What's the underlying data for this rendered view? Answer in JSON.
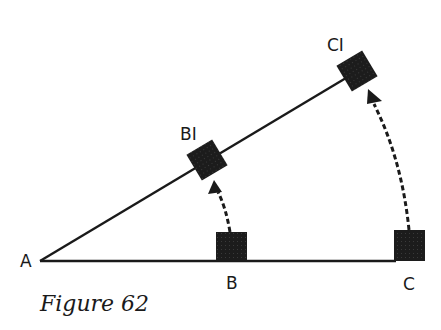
{
  "figure": {
    "caption": "Figure 62",
    "colors": {
      "ink": "#1a1a1a",
      "background": "#ffffff"
    },
    "points": {
      "A": {
        "label": "A"
      },
      "B": {
        "label": "B"
      },
      "C": {
        "label": "C"
      },
      "B1": {
        "label": "BI"
      },
      "C1": {
        "label": "CI"
      }
    },
    "elements": {
      "baseline": "line A to C",
      "slanted_line": "line A to C1",
      "square_B": "filled square at B",
      "square_C": "filled square at C",
      "square_B1": "rotated filled square at B1",
      "square_C1": "rotated filled square at C1",
      "arc_B_to_B1": "dashed arc with arrow from B to B1",
      "arc_C_to_C1": "dashed arc with arrow from C to C1"
    }
  }
}
